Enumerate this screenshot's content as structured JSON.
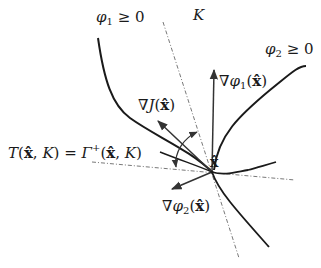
{
  "figure": {
    "labels": {
      "phi1_region": "φ₁ ≥ 0",
      "phi2_region": "φ₂ ≥ 0",
      "set_K": "K",
      "grad_phi1": "∇φ₁(x̂)",
      "grad_phi2": "∇φ₂(x̂)",
      "grad_J": "∇J(x̂)",
      "point": "x̂",
      "tangent_cone": "T(x̂, K) = Γ⁺(x̂, K)"
    },
    "parts": {
      "phi1_sym": "φ",
      "phi1_idx": "1",
      "phi1_rel": " ≥ 0",
      "phi2_sym": "φ",
      "phi2_idx": "2",
      "phi2_rel": " ≥ 0",
      "K": "K",
      "nabla": "∇",
      "J": "J",
      "open_paren": "(",
      "close_paren": ")",
      "xhat": "x̂",
      "T": "T",
      "comma_K": ", ",
      "equals": " = ",
      "Gamma": "Γ",
      "plus": "+"
    },
    "colors": {
      "curve": "#1a1a1a",
      "arrow": "#333333",
      "dashdot": "#555555",
      "background": "#ffffff"
    }
  }
}
